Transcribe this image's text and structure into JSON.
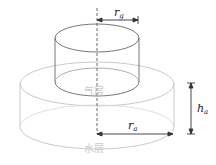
{
  "diagram": {
    "labels": {
      "r_g": {
        "main": "r",
        "sub": "g"
      },
      "h_a": {
        "main": "h",
        "sub": "a"
      },
      "r_a": {
        "main": "r",
        "sub": "a"
      }
    },
    "regions": {
      "gas_layer": "气层",
      "water_layer": "水层"
    },
    "colors": {
      "gas_cylinder_stroke": "#555555",
      "water_cylinder_stroke": "#bbbbbb",
      "dimension_line": "#333333"
    }
  }
}
